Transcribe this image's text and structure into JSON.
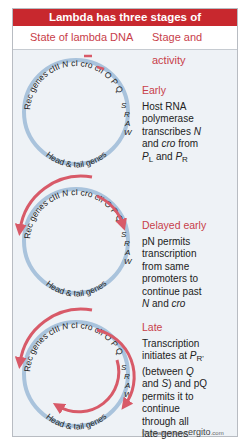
{
  "title": "Lambda has three stages of development",
  "headers": {
    "left": "State of lambda DNA",
    "right": "Stage and activity"
  },
  "genome_labels": {
    "top": "Rec genes cIII N cI cro cII O P Q",
    "right": [
      "S",
      "R",
      "A",
      "W"
    ],
    "bottom": "Head & tail genes"
  },
  "colors": {
    "title_bg": "#c8282e",
    "accent_text": "#c8404a",
    "dna_circle": "#a9c3dc",
    "transcript_arrow": "#d85a68",
    "panel_bg": "#eef2f6"
  },
  "stages": [
    {
      "name": "Early",
      "lines": [
        "Host RNA",
        "polymerase",
        "transcribes N",
        "and cro from",
        "PL and PR"
      ]
    },
    {
      "name": "Delayed early",
      "lines": [
        "pN permits",
        "transcription",
        "from same",
        "promoters to",
        "continue past",
        "N and cro"
      ]
    },
    {
      "name": "Late",
      "lines": [
        "Transcription",
        "initiates at PR'",
        "(between Q",
        "and S) and pQ",
        "permits it to",
        "continue",
        "through all",
        "late genes"
      ]
    }
  ],
  "credit": {
    "prefix": "©virtualtext www.",
    "brand": "ergito",
    "suffix": ".com"
  }
}
